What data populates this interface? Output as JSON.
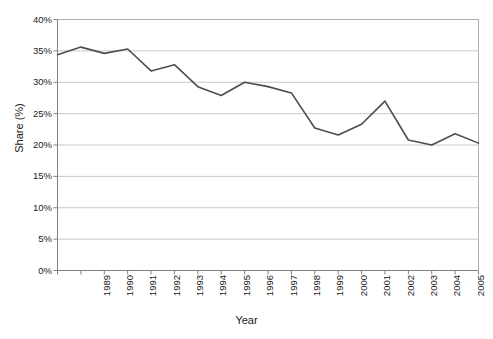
{
  "chart_data": {
    "type": "line",
    "title": "",
    "xlabel": "Year",
    "ylabel": "Share (%)",
    "categories": [
      "1989",
      "1990",
      "1991",
      "1992",
      "1993",
      "1994",
      "1995",
      "1996",
      "1997",
      "1998",
      "1999",
      "2000",
      "2001",
      "2002",
      "2003",
      "2004",
      "2005",
      "2006",
      "2007"
    ],
    "values": [
      34.4,
      35.6,
      34.6,
      35.3,
      31.8,
      32.8,
      29.3,
      27.9,
      30.0,
      29.3,
      28.3,
      22.7,
      21.6,
      23.3,
      27.0,
      20.8,
      20.0,
      21.8,
      20.3
    ],
    "series": [
      {
        "name": "Share",
        "color": "#4d4d4d",
        "values": [
          34.4,
          35.6,
          34.6,
          35.3,
          31.8,
          32.8,
          29.3,
          27.9,
          30.0,
          29.3,
          28.3,
          22.7,
          21.6,
          23.3,
          27.0,
          20.8,
          20.0,
          21.8,
          20.3
        ]
      }
    ],
    "ylim": [
      0,
      40
    ],
    "ytick_step": 5,
    "ytick_labels": [
      "0%",
      "5%",
      "10%",
      "15%",
      "20%",
      "25%",
      "30%",
      "35%",
      "40%"
    ],
    "ytick_values": [
      0,
      5,
      10,
      15,
      20,
      25,
      30,
      35,
      40
    ],
    "grid": true,
    "grid_axis": "y",
    "grid_color": "#c8c8c8",
    "legend": false,
    "legend_position": "none",
    "line_color": "#4d4d4d",
    "line_width": 1.6,
    "plot_border_color": "#b0b0b0",
    "axis_color": "#808080",
    "background": "#ffffff"
  }
}
